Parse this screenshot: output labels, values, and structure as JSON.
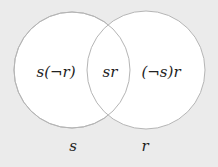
{
  "diagram": {
    "type": "venn",
    "sets": [
      {
        "name": "s",
        "label": "s"
      },
      {
        "name": "r",
        "label": "r"
      }
    ],
    "regions": {
      "s_only": "s(¬r)",
      "both": "sr",
      "r_only": "(¬s)r"
    },
    "colors": {
      "background": "#ebebeb",
      "fill": "#ffffff",
      "stroke": "#b5b5b5"
    }
  }
}
